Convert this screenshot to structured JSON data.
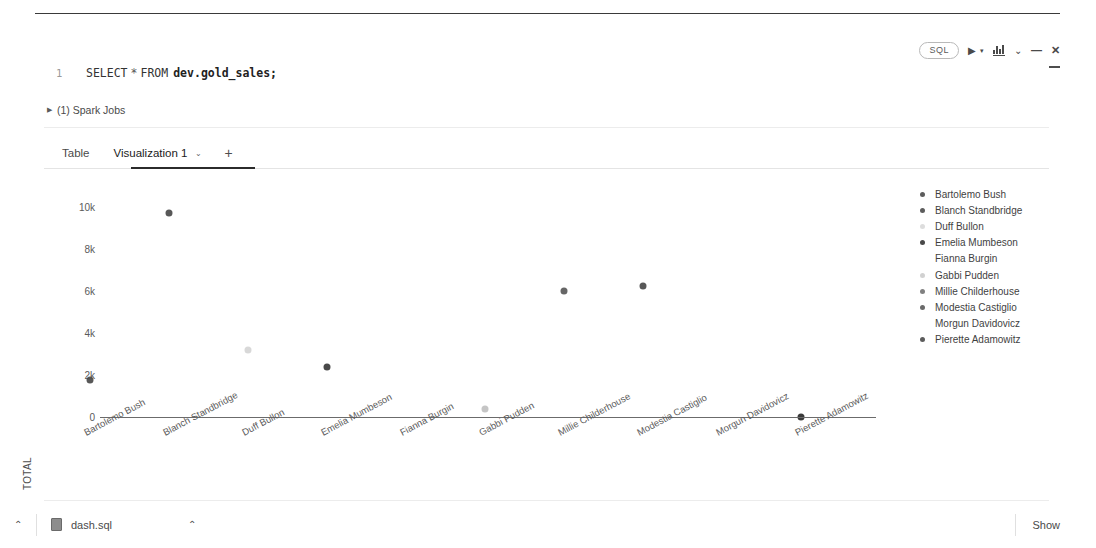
{
  "toolbar": {
    "sql_badge": "SQL",
    "run_label": "▶",
    "run_caret": "▾",
    "chart_icon_name": "bar-chart-icon",
    "chevron": "⌄",
    "minus": "—",
    "close": "✕"
  },
  "editor": {
    "line_number": "1",
    "keyword_select": "SELECT",
    "star": "*",
    "keyword_from": "FROM",
    "table": "dev.gold_sales;"
  },
  "spark": {
    "triangle": "▶",
    "label": "(1) Spark Jobs"
  },
  "tabs": {
    "table": "Table",
    "visualization": "Visualization 1",
    "caret": "⌄",
    "plus": "+"
  },
  "bottom": {
    "chevron_left": "⌃",
    "file_name": "dash.sql",
    "chevron_right": "⌃",
    "show": "Show"
  },
  "chart_data": {
    "type": "scatter",
    "title": "",
    "xlabel": "",
    "ylabel": "TOTAL",
    "ylim": [
      0,
      11000
    ],
    "yticks": [
      0,
      2000,
      4000,
      6000,
      8000,
      10000
    ],
    "ytick_labels": [
      "0",
      "2k",
      "4k",
      "6k",
      "8k",
      "10k"
    ],
    "grid": false,
    "legend_position": "right",
    "categories": [
      "Bartolemo Bush",
      "Blanch Standbridge",
      "Duff Bullon",
      "Emelia Mumbeson",
      "Fianna Burgin",
      "Gabbi Pudden",
      "Millie Childerhouse",
      "Modestia Castiglio",
      "Morgun Davidovicz",
      "Pierette Adamowitz"
    ],
    "points": [
      {
        "label": "Bartolemo Bush",
        "value": 1750,
        "color": "#4a4a4a",
        "opacity": 0.92
      },
      {
        "label": "Blanch Standbridge",
        "value": 9700,
        "color": "#4a4a4a",
        "opacity": 0.92
      },
      {
        "label": "Duff Bullon",
        "value": 3180,
        "color": "#b8b8b8",
        "opacity": 0.55
      },
      {
        "label": "Emelia Mumbeson",
        "value": 2400,
        "color": "#3f3f3f",
        "opacity": 0.95
      },
      {
        "label": "Fianna Burgin",
        "value": null,
        "color": "#dadada",
        "opacity": 0.0
      },
      {
        "label": "Gabbi Pudden",
        "value": 380,
        "color": "#9e9e9e",
        "opacity": 0.6
      },
      {
        "label": "Millie Childerhouse",
        "value": 6000,
        "color": "#555555",
        "opacity": 0.9
      },
      {
        "label": "Modestia Castiglio",
        "value": 6220,
        "color": "#4a4a4a",
        "opacity": 0.92
      },
      {
        "label": "Morgun Davidovicz",
        "value": null,
        "color": "#dadada",
        "opacity": 0.0
      },
      {
        "label": "Pierette Adamowitz",
        "value": 0,
        "color": "#3a3a3a",
        "opacity": 1.0
      }
    ],
    "legend": [
      {
        "label": "Bartolemo Bush",
        "color": "#4a4a4a",
        "opacity": 0.9
      },
      {
        "label": "Blanch Standbridge",
        "color": "#4a4a4a",
        "opacity": 0.9
      },
      {
        "label": "Duff Bullon",
        "color": "#cfcfcf",
        "opacity": 0.7
      },
      {
        "label": "Emelia Mumbeson",
        "color": "#3f3f3f",
        "opacity": 0.95
      },
      {
        "label": "Fianna Burgin",
        "color": "#ffffff",
        "opacity": 0.0
      },
      {
        "label": "Gabbi Pudden",
        "color": "#c2c2c2",
        "opacity": 0.75
      },
      {
        "label": "Millie Childerhouse",
        "color": "#6a6a6a",
        "opacity": 0.85
      },
      {
        "label": "Modestia Castiglio",
        "color": "#5a5a5a",
        "opacity": 0.9
      },
      {
        "label": "Morgun Davidovicz",
        "color": "#ffffff",
        "opacity": 0.0
      },
      {
        "label": "Pierette Adamowitz",
        "color": "#4a4a4a",
        "opacity": 0.9
      }
    ]
  }
}
